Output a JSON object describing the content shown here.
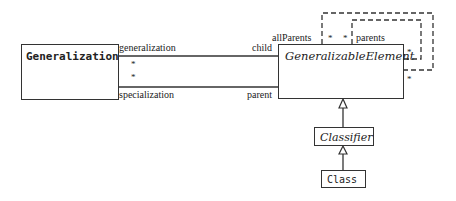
{
  "diagram": {
    "type": "UML class diagram",
    "classes": [
      {
        "id": "generalization",
        "name": "Generalization",
        "abstract": false
      },
      {
        "id": "generalizable_element",
        "name": "GeneralizableElement",
        "abstract": true
      },
      {
        "id": "classifier",
        "name": "Classifier",
        "abstract": true
      },
      {
        "id": "class",
        "name": "Class",
        "abstract": false
      }
    ],
    "associations": [
      {
        "from": "Generalization",
        "to": "GeneralizableElement",
        "from_role": "generalization",
        "to_role": "child",
        "from_multiplicity": "*"
      },
      {
        "from": "Generalization",
        "to": "GeneralizableElement",
        "from_role": "specialization",
        "to_role": "parent",
        "from_multiplicity": "*"
      }
    ],
    "derived_associations": [
      {
        "role": "allParents",
        "multiplicity_top": "*",
        "multiplicity_side": "*",
        "style": "dashed"
      },
      {
        "role": "parents",
        "multiplicity_top": "*",
        "multiplicity_side": "*",
        "style": "dashed"
      }
    ],
    "generalizations": [
      {
        "child": "Classifier",
        "parent": "GeneralizableElement"
      },
      {
        "child": "Class",
        "parent": "Classifier"
      }
    ]
  },
  "labels": {
    "generalization_class": "Generalization",
    "generalizable_element_class": "GeneralizableElement",
    "classifier_class": "Classifier",
    "class_class": "Class",
    "role_generalization": "generalization",
    "role_specialization": "specialization",
    "role_child": "child",
    "role_parent": "parent",
    "role_all_parents": "allParents",
    "role_parents": "parents",
    "mult_gen_top": "*",
    "mult_gen_bottom": "*",
    "mult_allparents_top": "*",
    "mult_parents_top": "*",
    "mult_parents_side": "*",
    "mult_allparents_side": "*"
  },
  "colors": {
    "line": "#333333",
    "background": "#ffffff"
  }
}
